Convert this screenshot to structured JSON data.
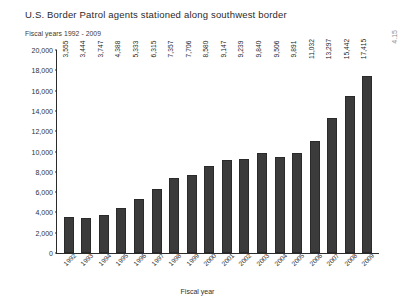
{
  "chart_data": {
    "type": "bar",
    "title": "U.S. Border Patrol agents stationed along southwest border",
    "subtitle": "Fiscal years 1992 - 2009",
    "xlabel": "Fiscal year",
    "ylabel": "",
    "ylim": [
      0,
      20000
    ],
    "grid": false,
    "legend": null,
    "bar_color": "#3b3b3b",
    "categories": [
      "1992",
      "1993",
      "1994",
      "1995",
      "1996",
      "1997",
      "1998",
      "1999",
      "2000",
      "2001",
      "2002",
      "2003",
      "2004",
      "2005",
      "2006",
      "2007",
      "2008",
      "2009"
    ],
    "values": [
      3555,
      3444,
      3747,
      4388,
      5333,
      6315,
      7357,
      7706,
      8580,
      9147,
      9239,
      9840,
      9506,
      9891,
      11032,
      13297,
      15442,
      17415
    ],
    "value_labels": [
      "3,555",
      "3,444",
      "3,747",
      "4,388",
      "5,333",
      "6,315",
      "7,357",
      "7,706",
      "8,580",
      "9,147",
      "9,239",
      "9,840",
      "9,506",
      "9,891",
      "11,032",
      "13,297",
      "15,442",
      "17,415"
    ],
    "y_ticks": [
      0,
      2000,
      4000,
      6000,
      8000,
      10000,
      12000,
      14000,
      16000,
      18000,
      20000
    ],
    "y_tick_labels": [
      "0",
      "2,000",
      "4,000",
      "6,000",
      "8,000",
      "10,000",
      "12,000",
      "14,000",
      "16,000",
      "18,000",
      "20,000"
    ]
  },
  "annotations": {
    "corner_artifact": "4.15"
  }
}
